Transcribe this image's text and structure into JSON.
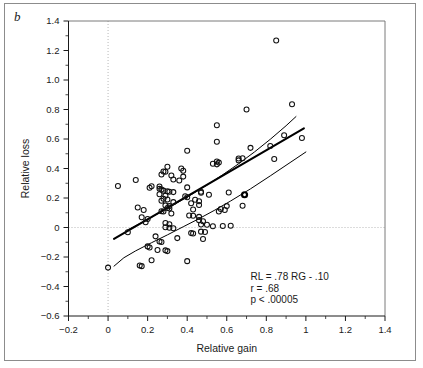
{
  "figure": {
    "panel_label": "b",
    "background_color": "#ffffff",
    "frame_color": "#8c8c8c"
  },
  "chart_data": {
    "type": "scatter",
    "title": "",
    "xlabel": "Relative gain",
    "ylabel": "Relative loss",
    "xlim": [
      -0.2,
      1.4
    ],
    "ylim": [
      -0.6,
      1.4
    ],
    "xticks": [
      -0.2,
      0,
      0.2,
      0.4,
      0.6,
      0.8,
      1,
      1.2,
      1.4
    ],
    "xticklabels": [
      "−0.2",
      "0",
      "0.2",
      "0.4",
      "0.6",
      "0.8",
      "1",
      "1.2",
      "1.4"
    ],
    "yticks": [
      -0.6,
      -0.4,
      -0.2,
      0,
      0.2,
      0.4,
      0.6,
      0.8,
      1.0,
      1.2,
      1.4
    ],
    "yticklabels": [
      "−0.6",
      "−0.4",
      "−0.2",
      "0",
      "0.2",
      "0.4",
      "0.6",
      "0.8",
      "1.0",
      "1.2",
      "1.4"
    ],
    "minor_ticks_per_interval": 1,
    "grid": "dotted reference lines at x = 0 and y = 0",
    "gridlines": [
      {
        "axis": "x",
        "value": 0,
        "style": "dotted"
      },
      {
        "axis": "y",
        "value": 0,
        "style": "dotted"
      }
    ],
    "marker": "open circle",
    "marker_size_px": 5,
    "legend": "none",
    "annotations": [
      {
        "text": "RL = .78 RG - .10",
        "x": 0.72,
        "y": -0.355
      },
      {
        "text": "r = .68",
        "x": 0.72,
        "y": -0.435
      },
      {
        "text": "p < .00005",
        "x": 0.72,
        "y": -0.515
      }
    ],
    "statistics": {
      "regression_equation": "RL = .78 RG - .10",
      "slope": 0.78,
      "intercept": -0.1,
      "correlation_r": 0.68,
      "p_value_text": "p < .00005"
    },
    "fit_line": {
      "name": "least-squares regression",
      "slope": 0.78,
      "intercept": -0.1,
      "x_range": [
        0.03,
        0.99
      ]
    },
    "confidence_bands": [
      {
        "name": "upper confidence band",
        "points": [
          [
            0.1,
            -0.015
          ],
          [
            0.18,
            0.04
          ],
          [
            0.26,
            0.1
          ],
          [
            0.34,
            0.16
          ],
          [
            0.42,
            0.222
          ],
          [
            0.5,
            0.288
          ],
          [
            0.58,
            0.358
          ],
          [
            0.66,
            0.432
          ],
          [
            0.74,
            0.512
          ],
          [
            0.82,
            0.598
          ],
          [
            0.9,
            0.69
          ],
          [
            0.95,
            0.752
          ]
        ]
      },
      {
        "name": "lower confidence band",
        "points": [
          [
            0.03,
            -0.262
          ],
          [
            0.08,
            -0.205
          ],
          [
            0.14,
            -0.158
          ],
          [
            0.22,
            -0.103
          ],
          [
            0.3,
            -0.05
          ],
          [
            0.38,
            0.005
          ],
          [
            0.46,
            0.06
          ],
          [
            0.54,
            0.118
          ],
          [
            0.62,
            0.18
          ],
          [
            0.72,
            0.262
          ],
          [
            0.82,
            0.35
          ],
          [
            0.92,
            0.44
          ],
          [
            1.0,
            0.512
          ]
        ]
      }
    ],
    "points": [
      [
        0.85,
        1.268
      ],
      [
        0.93,
        0.835
      ],
      [
        0.7,
        0.8
      ],
      [
        0.55,
        0.693
      ],
      [
        0.89,
        0.625
      ],
      [
        0.98,
        0.607
      ],
      [
        0.55,
        0.582
      ],
      [
        0.72,
        0.54
      ],
      [
        0.82,
        0.552
      ],
      [
        0.4,
        0.52
      ],
      [
        0.84,
        0.465
      ],
      [
        0.68,
        0.47
      ],
      [
        0.66,
        0.468
      ],
      [
        0.55,
        0.448
      ],
      [
        0.56,
        0.44
      ],
      [
        0.53,
        0.432
      ],
      [
        0.55,
        0.428
      ],
      [
        0.66,
        0.455
      ],
      [
        0.3,
        0.412
      ],
      [
        0.37,
        0.4
      ],
      [
        0.38,
        0.385
      ],
      [
        0.28,
        0.38
      ],
      [
        0.29,
        0.378
      ],
      [
        0.27,
        0.36
      ],
      [
        0.32,
        0.352
      ],
      [
        0.38,
        0.345
      ],
      [
        0.14,
        0.322
      ],
      [
        0.33,
        0.325
      ],
      [
        0.36,
        0.318
      ],
      [
        0.05,
        0.282
      ],
      [
        0.22,
        0.28
      ],
      [
        0.21,
        0.27
      ],
      [
        0.26,
        0.278
      ],
      [
        0.4,
        0.272
      ],
      [
        0.26,
        0.262
      ],
      [
        0.27,
        0.258
      ],
      [
        0.28,
        0.25
      ],
      [
        0.3,
        0.245
      ],
      [
        0.31,
        0.243
      ],
      [
        0.33,
        0.24
      ],
      [
        0.47,
        0.242
      ],
      [
        0.47,
        0.235
      ],
      [
        0.61,
        0.238
      ],
      [
        0.69,
        0.222
      ],
      [
        0.26,
        0.225
      ],
      [
        0.29,
        0.215
      ],
      [
        0.51,
        0.222
      ],
      [
        0.39,
        0.212
      ],
      [
        0.4,
        0.205
      ],
      [
        0.28,
        0.195
      ],
      [
        0.3,
        0.19
      ],
      [
        0.44,
        0.188
      ],
      [
        0.27,
        0.182
      ],
      [
        0.46,
        0.178
      ],
      [
        0.33,
        0.172
      ],
      [
        0.42,
        0.165
      ],
      [
        0.46,
        0.152
      ],
      [
        0.29,
        0.15
      ],
      [
        0.31,
        0.145
      ],
      [
        0.15,
        0.135
      ],
      [
        0.3,
        0.132
      ],
      [
        0.31,
        0.128
      ],
      [
        0.43,
        0.122
      ],
      [
        0.57,
        0.125
      ],
      [
        0.6,
        0.145
      ],
      [
        0.68,
        0.148
      ],
      [
        0.59,
        0.118
      ],
      [
        0.18,
        0.118
      ],
      [
        0.27,
        0.11
      ],
      [
        0.28,
        0.108
      ],
      [
        0.56,
        0.108
      ],
      [
        0.32,
        0.095
      ],
      [
        0.41,
        0.082
      ],
      [
        0.43,
        0.08
      ],
      [
        0.46,
        0.072
      ],
      [
        0.17,
        0.07
      ],
      [
        0.2,
        0.058
      ],
      [
        0.46,
        0.05
      ],
      [
        0.48,
        0.042
      ],
      [
        0.19,
        0.035
      ],
      [
        0.29,
        0.03
      ],
      [
        0.31,
        0.022
      ],
      [
        0.47,
        0.02
      ],
      [
        0.5,
        0.018
      ],
      [
        0.62,
        0.012
      ],
      [
        0.53,
        0.008
      ],
      [
        0.58,
        0.01
      ],
      [
        0.29,
        0.002
      ],
      [
        0.31,
        -0.002
      ],
      [
        0.33,
        -0.005
      ],
      [
        0.1,
        -0.032
      ],
      [
        0.47,
        -0.028
      ],
      [
        0.49,
        -0.03
      ],
      [
        0.42,
        -0.038
      ],
      [
        0.43,
        -0.04
      ],
      [
        0.35,
        -0.072
      ],
      [
        0.48,
        -0.078
      ],
      [
        0.24,
        -0.06
      ],
      [
        0.26,
        -0.095
      ],
      [
        0.27,
        -0.098
      ],
      [
        0.2,
        -0.128
      ],
      [
        0.21,
        -0.135
      ],
      [
        0.25,
        -0.152
      ],
      [
        0.29,
        -0.155
      ],
      [
        0.3,
        -0.16
      ],
      [
        0.22,
        -0.222
      ],
      [
        0.4,
        -0.228
      ],
      [
        0.16,
        -0.258
      ],
      [
        0.17,
        -0.262
      ],
      [
        0.0,
        -0.272
      ]
    ]
  }
}
